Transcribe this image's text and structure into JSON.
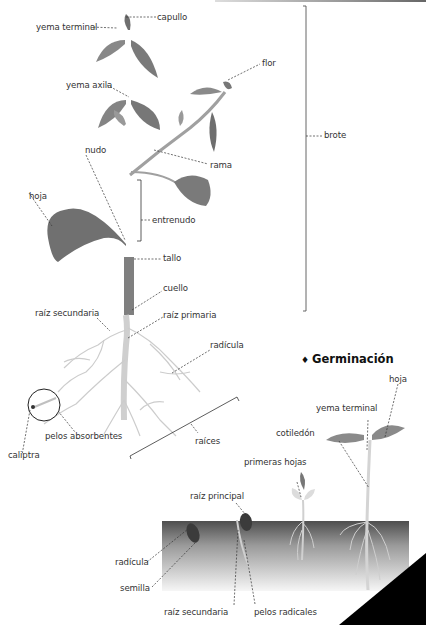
{
  "plant": {
    "labels": {
      "capullo": "capullo",
      "yema_terminal": "yema terminal",
      "flor": "flor",
      "yema_axila": "yema axila",
      "brote": "brote",
      "rama": "rama",
      "nudo": "nudo",
      "hoja": "hoja",
      "entrenudo": "entrenudo",
      "tallo": "tallo",
      "cuello": "cuello",
      "raiz_secundaria": "raíz secundaria",
      "raiz_primaria": "raíz primaria",
      "radicula": "radícula",
      "pelos_absorbentes": "pelos absorbentes",
      "caliptra": "caliptra",
      "raices": "raíces"
    }
  },
  "germination": {
    "title": "Germinación",
    "bullet": "♦",
    "labels": {
      "hoja": "hoja",
      "yema_terminal": "yema terminal",
      "cotiledon": "cotiledón",
      "primeras_hojas": "primeras hojas",
      "raiz_principal": "raíz principal",
      "radicula": "radícula",
      "semilla": "semilla",
      "raiz_secundaria": "raíz secundaria",
      "pelos_radicales": "pelos radicales"
    }
  },
  "colors": {
    "leaf": "#7d7d7d",
    "stem": "#9a9a9a",
    "root": "#c8c8c8",
    "soil_top": "#555555",
    "soil_bottom": "#f4f4f4",
    "corner": "#000000"
  }
}
